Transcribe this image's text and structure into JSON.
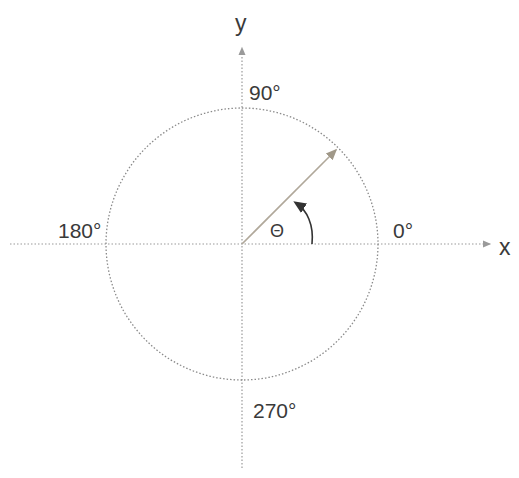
{
  "diagram": {
    "axes": {
      "x_label": "x",
      "y_label": "y"
    },
    "angle_labels": {
      "deg0": "0°",
      "deg90": "90°",
      "deg180": "180°",
      "deg270": "270°"
    },
    "angle_symbol": "Θ",
    "ray_angle_deg": 45,
    "colors": {
      "axis": "#9a9a9a",
      "circle": "#8a8a8a",
      "ray": "#b0a89a",
      "arc_arrow": "#333333",
      "text": "#3a3a3a"
    }
  }
}
